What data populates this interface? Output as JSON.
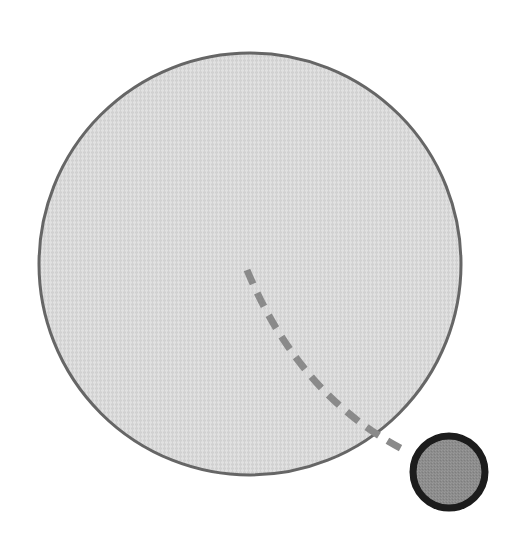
{
  "figure": {
    "title": "Schematic of a large textured disc with a dashed curve leading to a small dark disc",
    "canvas": {
      "width": 518,
      "height": 552,
      "background_color": "#ffffff"
    },
    "shapes": [
      {
        "id": "large-disc",
        "role": "primary-disc",
        "type": "circle",
        "center_x": 250,
        "center_y": 264,
        "radius": 211,
        "fill_color": "#d9d9d9",
        "stroke_color": "#666666",
        "stroke_width": 3,
        "texture": "woven-canvas",
        "texture_opacity": 0.35
      },
      {
        "id": "small-disc",
        "role": "secondary-disc",
        "type": "circle",
        "center_x": 449,
        "center_y": 472,
        "radius": 36,
        "fill_color": "#8c8c8c",
        "stroke_color": "#1a1a1a",
        "stroke_width": 7,
        "texture": "fine-grain",
        "texture_opacity": 0.3
      }
    ],
    "connector": {
      "id": "dashed-curve",
      "role": "connector-path",
      "type": "curved-dashed-line",
      "stroke_color": "#8a8a8a",
      "stroke_width": 7,
      "dash_length": 15,
      "gap_length": 10,
      "start_x": 247,
      "start_y": 270,
      "control_x": 300,
      "control_y": 398,
      "end_x": 408,
      "end_y": 452
    }
  }
}
